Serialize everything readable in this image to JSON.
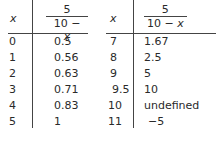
{
  "header": {
    "x_label": "x",
    "fraction": {
      "numerator": "5",
      "denominator_prefix": "10 − ",
      "denominator_var": "x"
    }
  },
  "left_table": {
    "rows": [
      {
        "x": "0",
        "value": "0.5"
      },
      {
        "x": "1",
        "value": "0.56"
      },
      {
        "x": "2",
        "value": "0.63"
      },
      {
        "x": "3",
        "value": "0.71"
      },
      {
        "x": "4",
        "value": "0.83"
      },
      {
        "x": "5",
        "value": "1"
      }
    ]
  },
  "right_table": {
    "rows": [
      {
        "x": "7",
        "value": "1.67"
      },
      {
        "x": "8",
        "value": "2.5"
      },
      {
        "x": "9",
        "value": "5"
      },
      {
        "x": "9.5",
        "value": "10"
      },
      {
        "x": "10",
        "value": "undefined"
      },
      {
        "x": "11",
        "value": "−5"
      }
    ]
  }
}
